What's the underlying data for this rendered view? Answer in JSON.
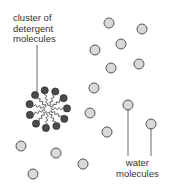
{
  "labels": {
    "detergent_lines": [
      "cluster of",
      "detergent",
      "molecules"
    ],
    "water_lines": [
      "water",
      "molecules"
    ]
  },
  "colors": {
    "water_fill": "#d9d9d9",
    "water_stroke": "#555555",
    "detergent_head": "#4a4a4a",
    "leader_line": "#444444"
  },
  "water_molecule_count": 15,
  "detergent_molecule_count": 11
}
